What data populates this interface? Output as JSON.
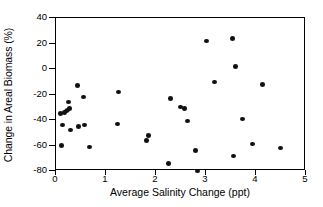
{
  "chart_data": {
    "type": "scatter",
    "title": "",
    "xlabel": "Average Salinity Change (ppt)",
    "ylabel": "Change in Areal Biomass (%)",
    "xlim": [
      0,
      5
    ],
    "ylim": [
      -80,
      40
    ],
    "xticks": [
      0,
      1,
      2,
      3,
      4,
      5
    ],
    "yticks": [
      -80,
      -60,
      -40,
      -20,
      0,
      20,
      40
    ],
    "xtick_labels": [
      "0",
      "1",
      "2",
      "3",
      "4",
      "5"
    ],
    "ytick_labels": [
      "-80",
      "-60",
      "-40",
      "-20",
      "0",
      "20",
      "40"
    ],
    "grid": false,
    "legend": null,
    "marker": "filled-circle",
    "marker_color": "#111111",
    "frame_color": "#000000",
    "background": "#ffffff",
    "series": [
      {
        "name": "Sites",
        "points": [
          {
            "x": 0.08,
            "y": -35
          },
          {
            "x": 0.1,
            "y": -60
          },
          {
            "x": 0.13,
            "y": -44
          },
          {
            "x": 0.17,
            "y": -34
          },
          {
            "x": 0.2,
            "y": -33
          },
          {
            "x": 0.22,
            "y": -32
          },
          {
            "x": 0.25,
            "y": -26
          },
          {
            "x": 0.27,
            "y": -31
          },
          {
            "x": 0.29,
            "y": -48
          },
          {
            "x": 0.42,
            "y": -13
          },
          {
            "x": 0.45,
            "y": -45
          },
          {
            "x": 0.54,
            "y": -22
          },
          {
            "x": 0.57,
            "y": -44
          },
          {
            "x": 0.67,
            "y": -61
          },
          {
            "x": 1.22,
            "y": -43
          },
          {
            "x": 1.25,
            "y": -18
          },
          {
            "x": 1.8,
            "y": -56
          },
          {
            "x": 1.84,
            "y": -52
          },
          {
            "x": 2.25,
            "y": -74
          },
          {
            "x": 2.29,
            "y": -23
          },
          {
            "x": 2.48,
            "y": -30
          },
          {
            "x": 2.57,
            "y": -31
          },
          {
            "x": 2.62,
            "y": -41
          },
          {
            "x": 2.78,
            "y": -64
          },
          {
            "x": 2.82,
            "y": -80
          },
          {
            "x": 3.0,
            "y": 22
          },
          {
            "x": 3.17,
            "y": -10
          },
          {
            "x": 3.52,
            "y": 24
          },
          {
            "x": 3.55,
            "y": -68
          },
          {
            "x": 3.58,
            "y": 2
          },
          {
            "x": 3.73,
            "y": -39
          },
          {
            "x": 3.92,
            "y": -59
          },
          {
            "x": 4.13,
            "y": -12
          },
          {
            "x": 4.48,
            "y": -62
          }
        ]
      }
    ]
  }
}
